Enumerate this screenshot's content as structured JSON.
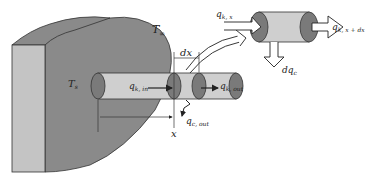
{
  "diagram": {
    "colors": {
      "wall_face": "#8a8a8a",
      "wall_side": "#c4c4c4",
      "fin_body": "#cfcfcf",
      "fin_cap": "#7a7a7a",
      "outline": "#333333",
      "background": "#ffffff"
    },
    "labels": {
      "T_inf": {
        "main": "T",
        "sub": "∞"
      },
      "T_s": {
        "main": "T",
        "sub": "s"
      },
      "dx": "dx",
      "x": "x",
      "q_k_in": {
        "main": "q",
        "sub": "k, in"
      },
      "q_k_out": {
        "main": "q",
        "sub": "k, out"
      },
      "q_c_out": {
        "main": "q",
        "sub": "c, out"
      },
      "q_k_x": {
        "main": "q",
        "sub": "k, x"
      },
      "q_k_x_dx": {
        "main": "q",
        "sub": "k, x + dx"
      },
      "dq_c": {
        "main": "dq",
        "sub": "c"
      }
    }
  }
}
